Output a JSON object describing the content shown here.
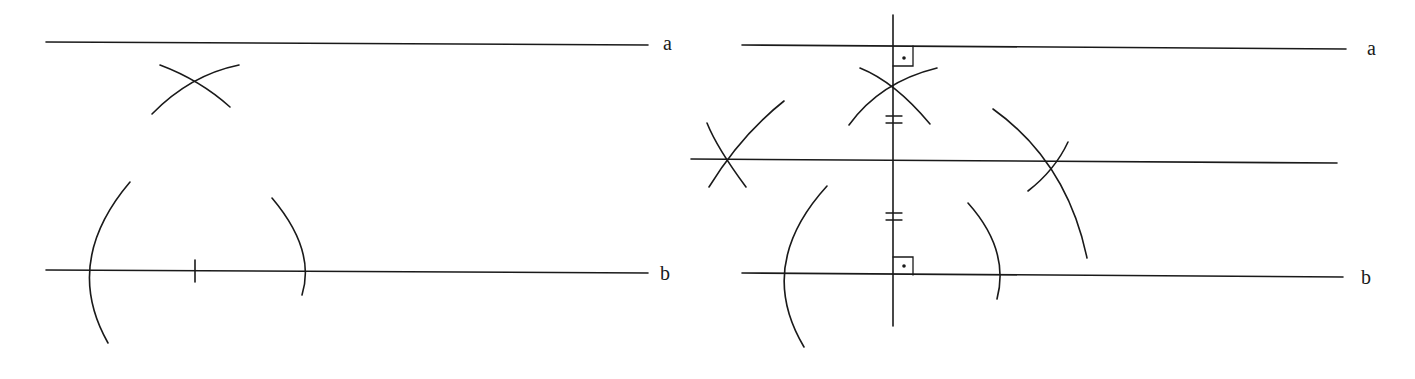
{
  "figure": {
    "left_panel": {
      "label_a": "a",
      "label_b": "b",
      "description": "Construction: point on line b marked, arcs drawn from it, arcs intersect above"
    },
    "right_panel": {
      "label_a": "a",
      "label_b": "b",
      "description": "Perpendicular to a and b, midpoint marked with equal-length hash marks, midparallel line constructed"
    }
  },
  "colors": {
    "ink": "#1a1a1a",
    "background": "#ffffff"
  }
}
